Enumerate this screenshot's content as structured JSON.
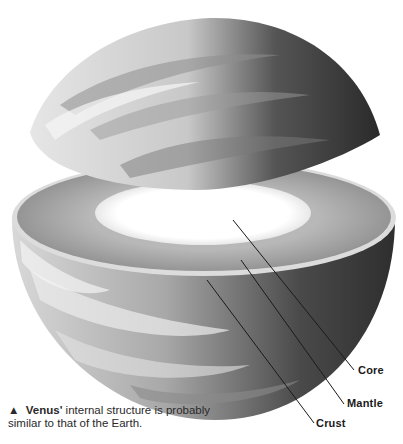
{
  "diagram": {
    "labels": {
      "core": "Core",
      "mantle": "Mantle",
      "crust": "Crust"
    },
    "layers": [
      {
        "name": "Core",
        "color": "#ffffff"
      },
      {
        "name": "Mantle",
        "color": "#9a9a9a"
      },
      {
        "name": "Crust",
        "color": "#d8d8d8"
      }
    ]
  },
  "caption": {
    "marker": "▲",
    "subject": "Venus'",
    "text": " internal structure is probably similar to that of the Earth."
  }
}
